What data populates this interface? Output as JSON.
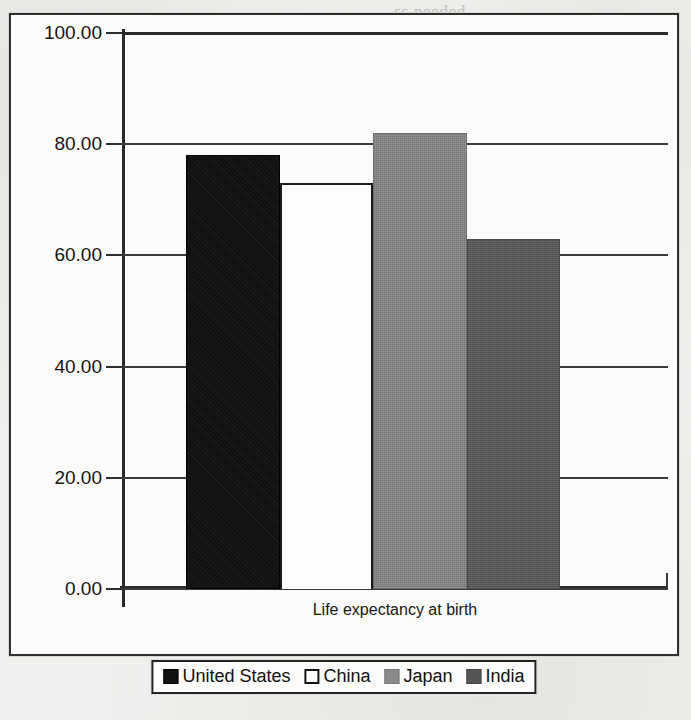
{
  "chart_data": {
    "type": "bar",
    "title": "",
    "categories": [
      "Life expectancy at birth"
    ],
    "xlabel": "Life expectancy at birth",
    "ylabel": "",
    "ylim": [
      0,
      100
    ],
    "ytick_step": 20,
    "ytick_labels": [
      "100.00",
      "80.00",
      "60.00",
      "40.00",
      "20.00",
      "0.00"
    ],
    "ytick_values": [
      100,
      80,
      60,
      40,
      20,
      0
    ],
    "grid": true,
    "legend_position": "bottom-center",
    "series": [
      {
        "name": "United States",
        "values": [
          78
        ],
        "color": "#111111",
        "swatch": "us"
      },
      {
        "name": "China",
        "values": [
          73
        ],
        "color": "#FFFFFF",
        "swatch": "china"
      },
      {
        "name": "Japan",
        "values": [
          82
        ],
        "color": "#848484",
        "swatch": "japan"
      },
      {
        "name": "India",
        "values": [
          63
        ],
        "color": "#555557",
        "swatch": "india"
      }
    ]
  },
  "axis": {
    "tick_0": "0.00",
    "tick_20": "20.00",
    "tick_40": "40.00",
    "tick_60": "60.00",
    "tick_80": "80.00",
    "tick_100": "100.00"
  },
  "legend": {
    "items": [
      {
        "label": "United States",
        "swatch": "us"
      },
      {
        "label": "China",
        "swatch": "china"
      },
      {
        "label": "Japan",
        "swatch": "japan"
      },
      {
        "label": "India",
        "swatch": "india"
      }
    ]
  },
  "category_title": "Life expectancy at birth",
  "scan_background": {
    "note": "faint show-through text from the reverse of the scanned page",
    "lines": [
      {
        "text": "ss needed",
        "left": 395,
        "top": 2
      },
      {
        "text": "two units",
        "left": 404,
        "top": 30
      },
      {
        "text": "e   upper left of the",
        "left": 316,
        "top": 58
      },
      {
        "text": "ing   numbers",
        "left": 372,
        "top": 86
      },
      {
        "text": "ntaining",
        "left": 418,
        "top": 114
      },
      {
        "text": "all   numbers",
        "left": 380,
        "top": 142
      },
      {
        "text": "r   resulting in",
        "left": 372,
        "top": 170
      },
      {
        "text": "cted   hold",
        "left": 400,
        "top": 212
      },
      {
        "text": "A0   wil",
        "left": 420,
        "top": 240
      },
      {
        "text": "of",
        "left": 455,
        "top": 268
      },
      {
        "text": "tains",
        "left": 350,
        "top": 424
      },
      {
        "text": "u   made   an",
        "left": 120,
        "top": 636
      }
    ]
  }
}
